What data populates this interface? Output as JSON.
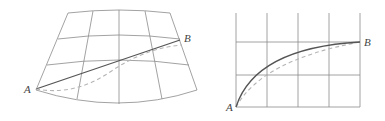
{
  "figure": {
    "left_panel": {
      "description": "Curved map projection graticule with straight line and dashed curve from A to B",
      "labels": {
        "start": "A",
        "end": "B"
      }
    },
    "right_panel": {
      "description": "Rectangular grid with solid curve and dashed curve from A to B",
      "labels": {
        "start": "A",
        "end": "B"
      }
    },
    "colors": {
      "grid": "#8a8a8a",
      "solid_path": "#555555",
      "dashed_path": "#b5b5b5",
      "label": "#444444"
    }
  }
}
